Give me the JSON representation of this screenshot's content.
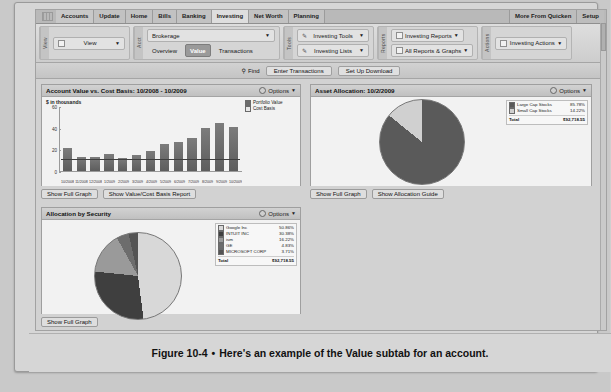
{
  "window": {
    "tabs": [
      "Accounts",
      "Update",
      "Home",
      "Bills",
      "Banking",
      "Investing",
      "Net Worth",
      "Planning"
    ],
    "active_tab": "Investing",
    "top_right": [
      "More From Quicken",
      "Setup"
    ]
  },
  "ribbon": {
    "groups": [
      {
        "label": "View",
        "rows": [
          [
            "View"
          ]
        ]
      },
      {
        "label": "Acct",
        "rows": [
          [
            "Brokerage"
          ],
          [
            "Overview",
            "Value",
            "Transactions"
          ]
        ]
      },
      {
        "label": "Tools",
        "rows": [
          [
            "Investing Tools"
          ],
          [
            "Investing Lists"
          ]
        ]
      },
      {
        "label": "Reports",
        "rows": [
          [
            "Investing Reports"
          ],
          [
            "All Reports & Graphs"
          ]
        ]
      },
      {
        "label": "Actions",
        "rows": [
          [
            "Investing Actions"
          ]
        ]
      }
    ],
    "selected_subtab": "Value",
    "view_label": "View",
    "account_label": "Brokerage",
    "subtabs": [
      "Overview",
      "Value",
      "Transactions"
    ],
    "tools": [
      "Investing Tools",
      "Investing Lists"
    ],
    "reports": [
      "Investing Reports",
      "All Reports & Graphs"
    ],
    "actions": [
      "Investing Actions"
    ]
  },
  "toolbar2": {
    "find": "Find",
    "enter_transactions": "Enter Transactions",
    "set_up_download": "Set Up Download"
  },
  "panels": {
    "value_chart": {
      "title": "Account Value vs. Cost Basis:  10/2008 - 10/2009",
      "options": "Options",
      "buttons": [
        "Show Full Graph",
        "Show Value/Cost Basis Report"
      ]
    },
    "asset_allocation": {
      "title": "Asset Allocation:  10/2/2009",
      "options": "Options",
      "buttons": [
        "Show Full Graph",
        "Show Allocation Guide"
      ]
    },
    "allocation_by_security": {
      "title": "Allocation by Security",
      "options": "Options",
      "buttons": [
        "Show Full Graph"
      ]
    }
  },
  "chart_data": [
    {
      "type": "bar",
      "title": "Account Value vs. Cost Basis:  10/2008 - 10/2009",
      "ylabel": "$ in thousands",
      "xlabel": "",
      "ylim": [
        0,
        60
      ],
      "yticks": [
        0,
        20,
        40,
        60
      ],
      "categories": [
        "10/2008",
        "11/2008",
        "12/2008",
        "1/2009",
        "2/2009",
        "3/2009",
        "4/2009",
        "5/2009",
        "6/2009",
        "7/2009",
        "8/2009",
        "9/2009",
        "10/2009"
      ],
      "legend": [
        "Portfolio Value",
        "Cost Basis"
      ],
      "legend_position": "top-right",
      "grid": false,
      "series": [
        {
          "name": "Portfolio Value",
          "values": [
            22,
            13,
            13,
            16,
            12,
            15,
            19,
            25,
            27,
            31,
            40,
            45,
            41
          ]
        }
      ],
      "cost_basis_level": 11
    },
    {
      "type": "pie",
      "title": "Asset Allocation:  10/2/2009",
      "labels": [
        "Large Cap Stocks",
        "Small Cap Stocks"
      ],
      "values": [
        85.78,
        14.22
      ],
      "value_labels": [
        "85.78%",
        "14.22%"
      ],
      "total_label": "Total",
      "total_value": "$92,718.55",
      "legend_position": "right"
    },
    {
      "type": "pie",
      "title": "Allocation by Security",
      "labels": [
        "Google Inc",
        "INTUIT INC",
        "ism",
        "GE",
        "MICROSOFT CORP"
      ],
      "values": [
        50.86,
        30.38,
        16.22,
        4.83,
        3.71
      ],
      "value_labels": [
        "50.86%",
        "30.38%",
        "16.22%",
        "4.83%",
        "3.71%"
      ],
      "total_label": "Total",
      "total_value": "$92,718.55",
      "legend_position": "right"
    }
  ],
  "caption": {
    "figure": "Figure 10-4",
    "dot": "•",
    "text": "Here's an example of the Value subtab for an account."
  }
}
